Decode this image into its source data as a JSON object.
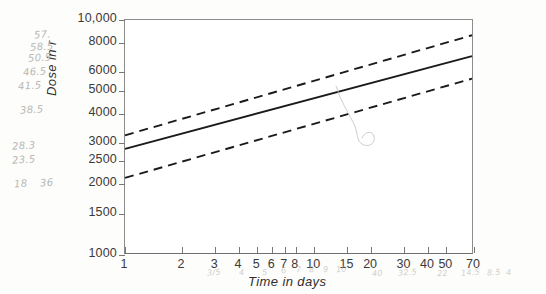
{
  "figure": {
    "background_color": "#fdfdfc",
    "plot_background_color": "#ffffff",
    "axis_color": "#8c8c8c",
    "line_color": "#1a1a1a",
    "pencil_color": "#a9a9a6"
  },
  "chart_data": {
    "type": "line",
    "title": "",
    "xlabel": "Time in days",
    "ylabel": "Dose in r",
    "xscale": "log",
    "yscale": "log",
    "xlim": [
      1,
      70
    ],
    "ylim": [
      1000,
      10000
    ],
    "grid": false,
    "legend": "none",
    "xticks": [
      1,
      2,
      3,
      4,
      5,
      6,
      7,
      8,
      10,
      15,
      20,
      30,
      40,
      50,
      70
    ],
    "xticklabels": [
      "1",
      "2",
      "3",
      "4",
      "5",
      "6",
      "7",
      "8",
      "10",
      "15",
      "20",
      "30",
      "40",
      "50",
      "70"
    ],
    "yticks": [
      1000,
      1500,
      2000,
      2500,
      3000,
      4000,
      5000,
      6000,
      8000,
      10000
    ],
    "yticklabels": [
      "1000",
      "1500",
      "2000",
      "2500",
      "3000",
      "4000",
      "5000",
      "6000",
      "8000",
      "10,000"
    ],
    "series": [
      {
        "name": "Upper bound",
        "style": "dashed",
        "x": [
          1,
          70
        ],
        "y": [
          3200,
          8600
        ]
      },
      {
        "name": "Mean dose",
        "style": "solid",
        "x": [
          1,
          70
        ],
        "y": [
          2800,
          7000
        ]
      },
      {
        "name": "Lower bound",
        "style": "dashed",
        "x": [
          1,
          70
        ],
        "y": [
          2100,
          5600
        ]
      }
    ]
  },
  "annotations": {
    "left_margin": [
      {
        "text": "57.",
        "x": 34,
        "y": 29
      },
      {
        "text": "58.5",
        "x": 30,
        "y": 41
      },
      {
        "text": "50.5",
        "x": 28,
        "y": 52
      },
      {
        "text": "46.5",
        "x": 23,
        "y": 66
      },
      {
        "text": "41.5",
        "x": 18,
        "y": 80
      },
      {
        "text": "38.5",
        "x": 20,
        "y": 104
      },
      {
        "text": "28.3",
        "x": 12,
        "y": 140
      },
      {
        "text": "23.5",
        "x": 12,
        "y": 154
      },
      {
        "text": "18",
        "x": 14,
        "y": 178
      },
      {
        "text": "36",
        "x": 40,
        "y": 177
      }
    ],
    "bottom_margin": [
      {
        "text": "3/5",
        "x": 207,
        "y": 268
      },
      {
        "text": "4",
        "x": 239,
        "y": 268
      },
      {
        "text": "5",
        "x": 262,
        "y": 268
      },
      {
        "text": "6",
        "x": 281,
        "y": 266
      },
      {
        "text": "7",
        "x": 296,
        "y": 265
      },
      {
        "text": "8",
        "x": 309,
        "y": 265
      },
      {
        "text": "9",
        "x": 323,
        "y": 265
      },
      {
        "text": "10",
        "x": 336,
        "y": 265
      },
      {
        "text": "40",
        "x": 372,
        "y": 269
      },
      {
        "text": "32.5",
        "x": 398,
        "y": 268
      },
      {
        "text": "22",
        "x": 437,
        "y": 269
      },
      {
        "text": "14.5",
        "x": 461,
        "y": 268
      },
      {
        "text": "8.5",
        "x": 487,
        "y": 268
      },
      {
        "text": "4",
        "x": 506,
        "y": 268
      }
    ]
  }
}
